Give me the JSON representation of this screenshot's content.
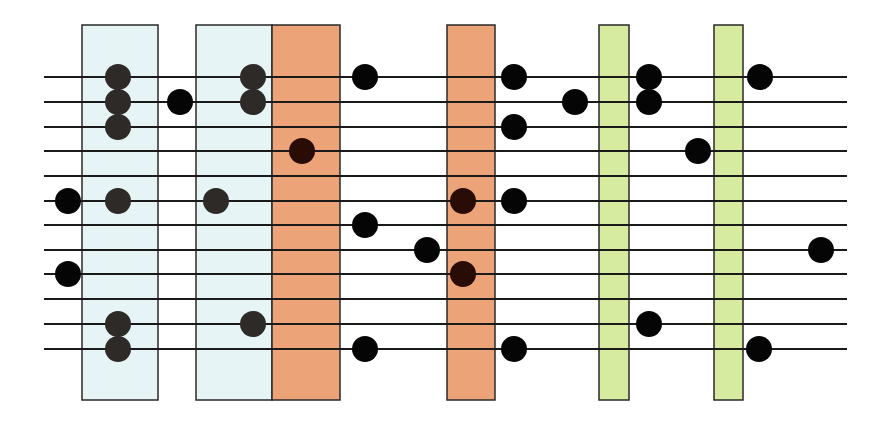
{
  "diagram": {
    "type": "scale-fretboard-diagram",
    "colors": {
      "background": "#ffffff",
      "line": "#1a1a1a",
      "dot_plain": "#050505",
      "dot_on_blue": "#2e2a28",
      "dot_on_orange": "#2a0c06",
      "blue_fill": "#e6f4f6",
      "orange_fill": "#eca377",
      "green_fill": "#d6eaa0",
      "box_border": "#2a2a2a"
    },
    "lines": {
      "x_start": 44,
      "x_end": 847,
      "y": [
        77,
        102,
        127,
        151,
        176,
        201,
        225,
        250,
        274,
        299,
        324,
        349
      ]
    },
    "boxes": [
      {
        "id": "blue-1",
        "color": "blue",
        "x": 82,
        "y": 25,
        "w": 76,
        "h": 375
      },
      {
        "id": "blue-2",
        "color": "blue",
        "x": 196,
        "y": 25,
        "w": 76,
        "h": 375
      },
      {
        "id": "orange-1",
        "color": "orange",
        "x": 272,
        "y": 25,
        "w": 68,
        "h": 375
      },
      {
        "id": "orange-2",
        "color": "orange",
        "x": 447,
        "y": 25,
        "w": 48,
        "h": 375
      },
      {
        "id": "green-1",
        "color": "green",
        "x": 599,
        "y": 25,
        "w": 30,
        "h": 375
      },
      {
        "id": "green-2",
        "color": "green",
        "x": 714,
        "y": 25,
        "w": 29,
        "h": 375
      }
    ],
    "dot_radius": 13,
    "dots": [
      {
        "cx": 68,
        "cy": 201,
        "tone": "plain"
      },
      {
        "cx": 68,
        "cy": 274,
        "tone": "plain"
      },
      {
        "cx": 118,
        "cy": 77,
        "tone": "blue"
      },
      {
        "cx": 118,
        "cy": 102,
        "tone": "blue"
      },
      {
        "cx": 118,
        "cy": 127,
        "tone": "blue"
      },
      {
        "cx": 118,
        "cy": 201,
        "tone": "blue"
      },
      {
        "cx": 118,
        "cy": 324,
        "tone": "blue"
      },
      {
        "cx": 118,
        "cy": 349,
        "tone": "blue"
      },
      {
        "cx": 180,
        "cy": 102,
        "tone": "plain"
      },
      {
        "cx": 216,
        "cy": 201,
        "tone": "blue"
      },
      {
        "cx": 253,
        "cy": 77,
        "tone": "blue"
      },
      {
        "cx": 253,
        "cy": 102,
        "tone": "blue"
      },
      {
        "cx": 253,
        "cy": 324,
        "tone": "blue"
      },
      {
        "cx": 302,
        "cy": 151,
        "tone": "orange"
      },
      {
        "cx": 365,
        "cy": 77,
        "tone": "plain"
      },
      {
        "cx": 365,
        "cy": 225,
        "tone": "plain"
      },
      {
        "cx": 365,
        "cy": 349,
        "tone": "plain"
      },
      {
        "cx": 427,
        "cy": 250,
        "tone": "plain"
      },
      {
        "cx": 463,
        "cy": 201,
        "tone": "orange"
      },
      {
        "cx": 463,
        "cy": 274,
        "tone": "orange"
      },
      {
        "cx": 514,
        "cy": 77,
        "tone": "plain"
      },
      {
        "cx": 514,
        "cy": 127,
        "tone": "plain"
      },
      {
        "cx": 514,
        "cy": 201,
        "tone": "plain"
      },
      {
        "cx": 514,
        "cy": 349,
        "tone": "plain"
      },
      {
        "cx": 575,
        "cy": 102,
        "tone": "plain"
      },
      {
        "cx": 649,
        "cy": 77,
        "tone": "plain"
      },
      {
        "cx": 649,
        "cy": 102,
        "tone": "plain"
      },
      {
        "cx": 649,
        "cy": 324,
        "tone": "plain"
      },
      {
        "cx": 698,
        "cy": 151,
        "tone": "plain"
      },
      {
        "cx": 760,
        "cy": 77,
        "tone": "plain"
      },
      {
        "cx": 759,
        "cy": 349,
        "tone": "plain"
      },
      {
        "cx": 821,
        "cy": 250,
        "tone": "plain"
      }
    ]
  }
}
